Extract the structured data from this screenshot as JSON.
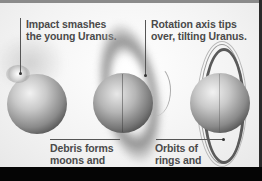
{
  "figure": {
    "stages": [
      {
        "id": "impact",
        "caption": "Impact smashes the young Uranus.",
        "caption_lines": [
          "Impact smashes",
          "the young Uranus."
        ]
      },
      {
        "id": "debris",
        "caption": "Debris forms moons and rings.",
        "caption_lines": [
          "Debris forms",
          "moons and",
          "rings."
        ]
      },
      {
        "id": "axis",
        "caption": "Rotation axis tips over, tilting Uranus.",
        "caption_lines": [
          "Rotation axis tips",
          "over, tilting Uranus."
        ]
      },
      {
        "id": "orbits",
        "caption": "Orbits of rings and moons also tilt.",
        "caption_lines": [
          "Orbits of",
          "rings and",
          "moons also tilt."
        ]
      }
    ]
  },
  "colors": {
    "background": "#f3f3f3",
    "text": "#4a4a4a",
    "frame": "#050505"
  }
}
